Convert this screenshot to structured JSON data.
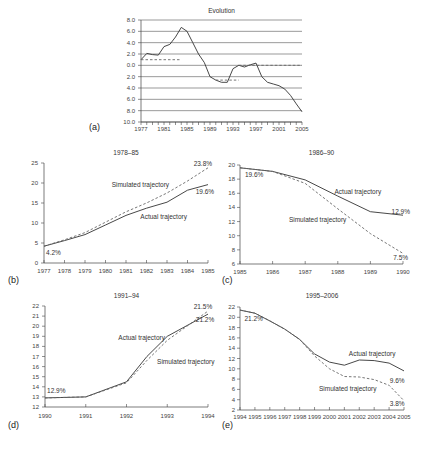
{
  "chart_data": [
    {
      "id": "a",
      "panel_label": "(a)",
      "type": "line",
      "title": "Evolution",
      "xlabel": "",
      "ylabel": "",
      "x_tick_labels": [
        "1977",
        "1981",
        "1985",
        "1989",
        "1993",
        "1997",
        "2001",
        "2005"
      ],
      "y_tick_labels": [
        "8.0",
        "6.0",
        "4.0",
        "2.0",
        "0.0",
        "2.0",
        "4.0",
        "6.0",
        "8.0",
        "10.0"
      ],
      "ylim": [
        -10,
        8
      ],
      "xlim": [
        1977,
        2005
      ],
      "grid": true,
      "series": [
        {
          "name": "Actual",
          "style": "solid",
          "x": [
            1977,
            1978,
            1979,
            1980,
            1981,
            1982,
            1983,
            1984,
            1985,
            1986,
            1987,
            1988,
            1989,
            1990,
            1991,
            1992,
            1993,
            1994,
            1995,
            1996,
            1997,
            1998,
            1999,
            2000,
            2001,
            2002,
            2003,
            2004,
            2005
          ],
          "y": [
            1.0,
            2.1,
            1.9,
            1.8,
            3.3,
            3.7,
            5.0,
            6.7,
            6.0,
            4.0,
            2.0,
            0.5,
            -2.0,
            -2.6,
            -3.0,
            -3.0,
            -0.6,
            0.0,
            -0.3,
            0.1,
            0.4,
            -2.0,
            -3.0,
            -3.3,
            -3.6,
            -4.2,
            -5.3,
            -6.8,
            -8.2
          ]
        },
        {
          "name": "Trend 1977-84",
          "style": "dashed",
          "x": [
            1977,
            1984
          ],
          "y": [
            1.0,
            1.0
          ]
        },
        {
          "name": "Trend 1990-94",
          "style": "dashed",
          "x": [
            1990,
            1994
          ],
          "y": [
            -2.6,
            -2.6
          ]
        },
        {
          "name": "Trend 1994-2005",
          "style": "dashed",
          "x": [
            1994,
            2005
          ],
          "y": [
            0.0,
            0.0
          ]
        }
      ]
    },
    {
      "id": "b",
      "panel_label": "(b)",
      "type": "line",
      "title": "1978–85",
      "x_tick_labels": [
        "1977",
        "1978",
        "1979",
        "1980",
        "1981",
        "1982",
        "1983",
        "1984",
        "1985"
      ],
      "y_tick_labels": [
        "0",
        "5",
        "10",
        "15",
        "20",
        "25"
      ],
      "ylim": [
        0,
        25
      ],
      "xlim": [
        1977,
        1985
      ],
      "grid": false,
      "series": [
        {
          "name": "Actual trajectory",
          "style": "solid",
          "x": [
            1977,
            1978,
            1979,
            1980,
            1981,
            1982,
            1983,
            1984,
            1985
          ],
          "y": [
            4.2,
            5.6,
            7.1,
            9.5,
            11.9,
            13.7,
            15.2,
            18.2,
            19.6
          ]
        },
        {
          "name": "Simulated trajectory",
          "style": "dashed",
          "x": [
            1977,
            1978,
            1979,
            1980,
            1981,
            1982,
            1983,
            1984,
            1985
          ],
          "y": [
            4.2,
            5.8,
            7.6,
            10.2,
            12.8,
            15.0,
            17.5,
            20.5,
            23.8
          ]
        }
      ],
      "annotations": [
        {
          "text": "4.2%",
          "x": 1977.1,
          "y": 2.0
        },
        {
          "text": "23.8%",
          "x": 1984.3,
          "y": 24.3
        },
        {
          "text": "19.6%",
          "x": 1984.4,
          "y": 17.2
        },
        {
          "text": "Simulated trajectory",
          "x": 1980.3,
          "y": 19.0
        },
        {
          "text": "Actual trajectory",
          "x": 1981.7,
          "y": 11.0
        }
      ]
    },
    {
      "id": "c",
      "panel_label": "(c)",
      "type": "line",
      "title": "1986–90",
      "x_tick_labels": [
        "1985",
        "1986",
        "1987",
        "1988",
        "1989",
        "1990"
      ],
      "y_tick_labels": [
        "6",
        "8",
        "10",
        "12",
        "14",
        "16",
        "18",
        "20"
      ],
      "ylim": [
        6,
        20
      ],
      "xlim": [
        1985,
        1990
      ],
      "grid": false,
      "series": [
        {
          "name": "Actual trajectory",
          "style": "solid",
          "x": [
            1985,
            1986,
            1987,
            1988,
            1989,
            1990
          ],
          "y": [
            19.6,
            19.1,
            17.9,
            15.6,
            13.4,
            12.9
          ]
        },
        {
          "name": "Simulated trajectory",
          "style": "dashed",
          "x": [
            1985,
            1986,
            1987,
            1988,
            1989,
            1990
          ],
          "y": [
            19.6,
            19.1,
            17.4,
            13.8,
            10.3,
            7.5
          ]
        }
      ],
      "annotations": [
        {
          "text": "19.6%",
          "x": 1985.15,
          "y": 18.3
        },
        {
          "text": "Actual trajectory",
          "x": 1987.9,
          "y": 15.9
        },
        {
          "text": "12.9%",
          "x": 1989.65,
          "y": 13.1
        },
        {
          "text": "Simulated trajectory",
          "x": 1986.5,
          "y": 11.9
        },
        {
          "text": "7.5%",
          "x": 1989.7,
          "y": 6.6
        }
      ]
    },
    {
      "id": "d",
      "panel_label": "(d)",
      "type": "line",
      "title": "1991–94",
      "x_tick_labels": [
        "1990",
        "1991",
        "1992",
        "1993",
        "1994"
      ],
      "y_tick_labels": [
        "12",
        "13",
        "14",
        "15",
        "16",
        "17",
        "18",
        "19",
        "20",
        "21",
        "22"
      ],
      "ylim": [
        12,
        22
      ],
      "xlim": [
        1990,
        1994
      ],
      "grid": false,
      "series": [
        {
          "name": "Actual trajectory",
          "style": "solid",
          "x": [
            1990,
            1991,
            1992,
            1992.5,
            1993,
            1994
          ],
          "y": [
            12.9,
            13.0,
            14.5,
            17.0,
            19.0,
            21.2
          ]
        },
        {
          "name": "Simulated trajectory",
          "style": "dashed",
          "x": [
            1990,
            1991,
            1992,
            1992.5,
            1993,
            1994
          ],
          "y": [
            12.9,
            13.0,
            14.4,
            16.6,
            18.6,
            21.5
          ]
        }
      ],
      "annotations": [
        {
          "text": "12.9%",
          "x": 1990.05,
          "y": 13.4
        },
        {
          "text": "21.5%",
          "x": 1993.65,
          "y": 21.7
        },
        {
          "text": "21.2%",
          "x": 1993.7,
          "y": 20.4
        },
        {
          "text": "Actual trajectory",
          "x": 1991.8,
          "y": 18.6
        },
        {
          "text": "Simulated trajectory",
          "x": 1992.75,
          "y": 16.3
        }
      ]
    },
    {
      "id": "e",
      "panel_label": "(e)",
      "type": "line",
      "title": "1995–2006",
      "x_tick_labels": [
        "1994",
        "1995",
        "1996",
        "1997",
        "1998",
        "1999",
        "2000",
        "2001",
        "2002",
        "2003",
        "2004",
        "2005"
      ],
      "y_tick_labels": [
        "2",
        "4",
        "6",
        "8",
        "10",
        "12",
        "14",
        "16",
        "18",
        "20",
        "22"
      ],
      "ylim": [
        2,
        22
      ],
      "xlim": [
        1994,
        2005
      ],
      "grid": false,
      "series": [
        {
          "name": "Actual trajectory",
          "style": "solid",
          "x": [
            1994,
            1995,
            1996,
            1997,
            1998,
            1999,
            2000,
            2001,
            2002,
            2003,
            2004,
            2005
          ],
          "y": [
            21.4,
            20.8,
            19.3,
            17.7,
            15.7,
            12.9,
            11.3,
            10.7,
            11.7,
            11.6,
            11.1,
            9.6
          ]
        },
        {
          "name": "Simulated trajectory",
          "style": "dashed",
          "x": [
            1994,
            1995,
            1996,
            1997,
            1998,
            1999,
            2000,
            2001,
            2002,
            2003,
            2004,
            2005
          ],
          "y": [
            21.4,
            20.8,
            19.3,
            17.7,
            15.7,
            12.5,
            10.0,
            8.5,
            8.4,
            7.9,
            6.8,
            3.8
          ]
        }
      ],
      "annotations": [
        {
          "text": "21.2%",
          "x": 1994.3,
          "y": 19.3
        },
        {
          "text": "Actual trajectory",
          "x": 2001.3,
          "y": 12.5
        },
        {
          "text": "9.6%",
          "x": 2004.05,
          "y": 7.2
        },
        {
          "text": "Simulated trajectory",
          "x": 1999.3,
          "y": 5.6
        },
        {
          "text": "3.8%",
          "x": 2004.05,
          "y": 2.8
        }
      ]
    }
  ],
  "layout": {
    "panels": {
      "a": {
        "x0": 141,
        "x1": 302,
        "y0": 20,
        "y1": 122,
        "title_y": 13,
        "label_x": 89,
        "label_y": 130,
        "axis_left": true,
        "x_tick_count": 29,
        "x_label_every": 4,
        "tick_x_label_y": 131,
        "ylab_x": 135,
        "grid_x1": 302
      },
      "b": {
        "x0": 44,
        "x1": 208,
        "y0": 163,
        "y1": 263,
        "title_y": 155,
        "label_x": 8,
        "label_y": 283,
        "tick_x_label_y": 273,
        "ylab_x": 38
      },
      "c": {
        "x0": 240,
        "x1": 403,
        "y0": 165,
        "y1": 264,
        "title_y": 155,
        "label_x": 222,
        "label_y": 283,
        "tick_x_label_y": 274,
        "ylab_x": 235
      },
      "d": {
        "x0": 45,
        "x1": 208,
        "y0": 306,
        "y1": 407,
        "title_y": 298,
        "label_x": 8,
        "label_y": 428,
        "tick_x_label_y": 418,
        "ylab_x": 39
      },
      "e": {
        "x0": 240,
        "x1": 404,
        "y0": 307,
        "y1": 410,
        "title_y": 298,
        "label_x": 222,
        "label_y": 428,
        "tick_x_label_y": 419,
        "ylab_x": 235
      }
    }
  }
}
